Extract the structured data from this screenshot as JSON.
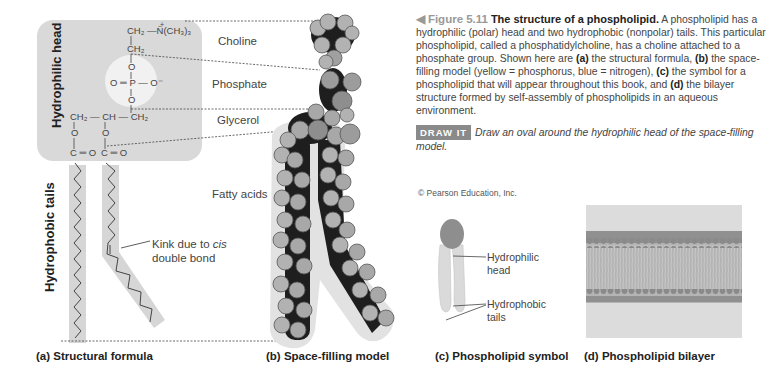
{
  "structural_formula": {
    "region_labels": {
      "hydrophilic_head": "Hydrophilic head",
      "hydrophobic_tails": "Hydrophobic tails"
    },
    "chem": {
      "choline_top": "CH₂ —N̈(CH₃)₃",
      "choline_plus": "+",
      "ch2_upper": "CH₂",
      "o_upper": "O",
      "phosphate_row": "O ═ P — O⁻",
      "o_lower": "O",
      "glycerol_row": "CH₂ — CH — CH₂",
      "o_left": "O",
      "o_mid": "O",
      "co_left": "C ═ O",
      "co_mid": "C ═ O"
    },
    "component_labels": {
      "choline": "Choline",
      "phosphate": "Phosphate",
      "glycerol": "Glycerol",
      "fatty_acids": "Fatty acids"
    },
    "kink_label_line1": "Kink due to ",
    "kink_label_cis": "cis",
    "kink_label_line2": "double bond"
  },
  "captions": {
    "a": "(a) Structural formula",
    "b": "(b) Space-filling model",
    "c": "(c) Phospholipid symbol",
    "d": "(d) Phospholipid bilayer"
  },
  "symbol": {
    "head_label_1": "Hydrophilic",
    "head_label_2": "head",
    "tails_label_1": "Hydrophobic",
    "tails_label_2": "tails"
  },
  "figure_text": {
    "arrow": "◀",
    "number": "Figure 5.11",
    "title": "The structure of a phospholipid.",
    "body_1": "A phospholipid has a hydrophilic (polar) head and two hydrophobic (nonpolar) tails. This particular phospholipid, called a phosphatidylcholine, has a choline attached to a phosphate group. Shown here are ",
    "a_tag": "(a)",
    "body_2": " the structural formula, ",
    "b_tag": "(b)",
    "body_3": " the space-filling model (yellow = phosphorus, blue = nitrogen), ",
    "c_tag": "(c)",
    "body_4": " the symbol for a phospholipid that will appear throughout this book, and ",
    "d_tag": "(d)",
    "body_5": " the bilayer structure formed by self-assembly of phospholipids in an aqueous environment.",
    "draw_it_badge": "DRAW IT",
    "draw_it_text": "Draw an oval around the hydrophilic head of the space-filling model."
  },
  "copyright": "© Pearson Education, Inc.",
  "colors": {
    "head_box": "#d9d9d9",
    "tail_band": "#d6d6d6",
    "atom_gray": "#a8a8a8",
    "atom_dark": "#1e1e1e",
    "draw_it_bg": "#8a8a8a",
    "bilayer_head": "#8e8e8e",
    "bilayer_bg": "#dcdcdc"
  }
}
